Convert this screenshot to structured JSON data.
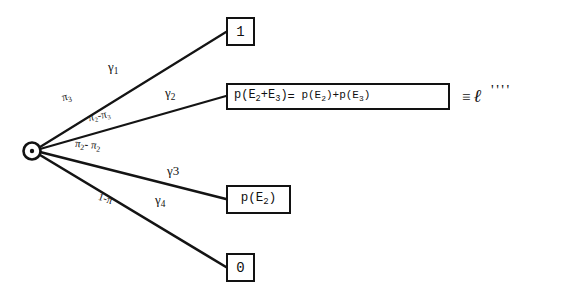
{
  "diagram": {
    "type": "decision-tree",
    "root": {
      "name": "chance-node",
      "shape": "circle-with-dot",
      "x": 32,
      "y": 148
    },
    "background_color": "#ffffff",
    "ink_color": "#121212",
    "branches": [
      {
        "id": "branch-1",
        "probability_label": "π₃",
        "payoff_label": "γ₁",
        "outcome": "1",
        "outcome_box": "box-one"
      },
      {
        "id": "branch-2",
        "probability_label": "π₂-π₃",
        "payoff_label": "γ₂",
        "outcome": "p(E₂+E₃)= p(E₂)+p(E₃)",
        "outcome_box": "box-sum"
      },
      {
        "id": "branch-3",
        "probability_label": "π₂- π₂",
        "payoff_label": "γ₃",
        "outcome": "p(E₂)",
        "outcome_box": "box-pe2"
      },
      {
        "id": "branch-4",
        "probability_label": "1-π",
        "payoff_label": "γ₄",
        "outcome": "0",
        "outcome_box": "box-zero"
      }
    ]
  },
  "boxes": {
    "one": "1",
    "zero": "0",
    "pe2_prefix": "p(E",
    "pe2_sub": "2",
    "pe2_suffix": ")",
    "sum_equation": {
      "lhs_p": "p(E",
      "lhs_sub_a": "2",
      "lhs_plus": "+E",
      "lhs_sub_b": "3",
      "lhs_close": ")",
      "equals": "=",
      "rhs_p1": "p(E",
      "rhs_sub_1": "2",
      "rhs_close_1": ")+p(E",
      "rhs_sub_2": "3",
      "rhs_close_2": ")"
    }
  },
  "labels": {
    "gamma_1": "γ",
    "gamma_1_sub": "1",
    "gamma_2": "γ",
    "gamma_2_sub": "2",
    "gamma_3": "γ",
    "gamma_3_sub": "3",
    "gamma_4": "γ",
    "gamma_4_sub": "4",
    "pi_3": "π",
    "pi_3_sub": "3",
    "pi_2_minus_pi_3": "π₂-π₃",
    "pi_2_minus_pi_2_a": "π",
    "pi_2_minus_pi_2_a_sub": "2",
    "pi_2_minus_pi_2_mid": "-",
    "pi_2_minus_pi_2_b": "π",
    "pi_2_minus_pi_2_b_sub": "2",
    "one_minus_pi": "1-π"
  },
  "annotation": {
    "equivalence_sign": "≡",
    "ell_symbol": "ℓ",
    "tick_marks": "''''"
  }
}
